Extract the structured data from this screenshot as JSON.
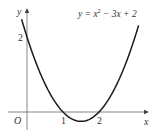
{
  "chart_data": {
    "type": "line",
    "title": "",
    "equation": "y = x² − 3x + 2",
    "equation_parts": {
      "lhs": "y = x",
      "exp": "2",
      "rhs": " − 3x + 2"
    },
    "xlabel": "x",
    "ylabel": "y",
    "origin_label": "O",
    "x_ticks": [
      "1",
      "2"
    ],
    "y_ticks": [
      "2"
    ],
    "x_range": [
      -0.15,
      3.05
    ],
    "y_range": [
      -0.3,
      2.45
    ],
    "roots": [
      1,
      2
    ],
    "y_intercept": 2,
    "vertex": [
      1.5,
      -0.25
    ],
    "grid": false,
    "series": [
      {
        "name": "y = x^2 - 3x + 2",
        "function": "x^2 - 3x + 2",
        "domain": [
          -0.15,
          3.1
        ]
      }
    ],
    "colors": {
      "curve": "#1a1a1a",
      "axis": "#555555"
    }
  }
}
